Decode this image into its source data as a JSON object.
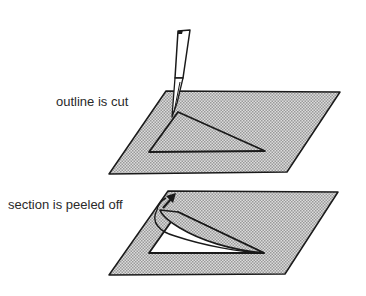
{
  "diagram": {
    "steps": [
      {
        "label": "outline is cut"
      },
      {
        "label": "section is peeled off"
      }
    ],
    "colors": {
      "line": "#1a1a1a",
      "plate_fill": "#c8c8c8",
      "background": "#ffffff"
    }
  }
}
